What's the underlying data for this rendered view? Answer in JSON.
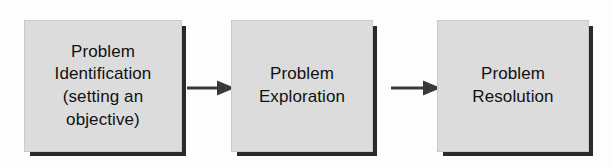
{
  "diagram": {
    "type": "linear-flowchart",
    "orientation": "left-to-right",
    "background_color": "#fdfdfd",
    "box_fill_color": "#dcdcdc",
    "box_shadow_color": "#2a2a2a",
    "text_color": "#111111",
    "arrow_color": "#3a3a3a",
    "nodes": [
      {
        "id": "identification",
        "label": "Problem\nIdentification\n(setting an\nobjective)",
        "lines": [
          "Problem",
          "Identification",
          "(setting an",
          "objective)"
        ],
        "order": 1
      },
      {
        "id": "exploration",
        "label": "Problem\nExploration",
        "lines": [
          "Problem",
          "Exploration"
        ],
        "order": 2
      },
      {
        "id": "resolution",
        "label": "Problem\nResolution",
        "lines": [
          "Problem",
          "Resolution"
        ],
        "order": 3
      }
    ],
    "connectors": [
      {
        "id": "arrow-1",
        "from": "identification",
        "to": "exploration",
        "style": "solid-arrow"
      },
      {
        "id": "arrow-2",
        "from": "exploration",
        "to": "resolution",
        "style": "solid-arrow"
      }
    ]
  }
}
